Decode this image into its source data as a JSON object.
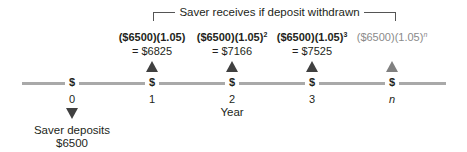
{
  "diagram": {
    "bracket_label": "Saver receives if deposit withdrawn",
    "axis_label": "Year",
    "marker_symbol": "$",
    "periods": [
      {
        "label": "0",
        "x": 72
      },
      {
        "label": "1",
        "x": 152
      },
      {
        "label": "2",
        "x": 232
      },
      {
        "label": "3",
        "x": 312
      },
      {
        "label": "n",
        "x": 392
      }
    ],
    "deposit": {
      "period": "0",
      "label": "Saver deposits",
      "amount": "$6500"
    },
    "withdrawals": [
      {
        "period": "1",
        "expr": "($6500)(1.05)",
        "exponent": "",
        "result": "= $6825"
      },
      {
        "period": "2",
        "expr": "($6500)(1.05)",
        "exponent": "2",
        "result": "= $7166"
      },
      {
        "period": "3",
        "expr": "($6500)(1.05)",
        "exponent": "3",
        "result": "= $7525"
      },
      {
        "period": "n",
        "expr": "($6500)(1.05)",
        "exponent": "n",
        "result": ""
      }
    ],
    "colors": {
      "timeline": "#a9a9a9",
      "arrow": "#404040",
      "muted_text": "#8a8a8a",
      "text": "#231f20"
    }
  }
}
